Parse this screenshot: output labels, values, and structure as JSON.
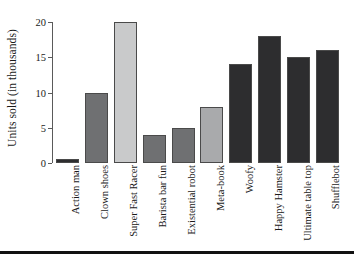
{
  "chart_data": {
    "type": "bar",
    "title": "",
    "xlabel": "",
    "ylabel": "Units sold (in thousands)",
    "ylim": [
      0,
      20
    ],
    "yticks": [
      0,
      5,
      10,
      15,
      20
    ],
    "ytick_labels": [
      "0",
      "5",
      "10",
      "15",
      "20"
    ],
    "grid": false,
    "legend": "none",
    "categories": [
      "Action man",
      "Clown shoes",
      "Super Fast Racer",
      "Barista bar fun",
      "Existential robot",
      "Meta-book",
      "Woofy",
      "Happy Hamster",
      "Ultimate table top",
      "Shufflebot"
    ],
    "values": [
      0.5,
      10,
      20,
      4,
      5,
      8,
      14,
      18,
      15,
      16
    ],
    "bar_colors": [
      "#2d2d2f",
      "#6f7072",
      "#c9cacb",
      "#6f7072",
      "#6f7072",
      "#a9aaac",
      "#2d2d2f",
      "#2d2d2f",
      "#2d2d2f",
      "#2d2d2f"
    ]
  },
  "style": {
    "background": "#ffffff",
    "axis_color": "#5a5a5a",
    "bar_edge_color": "#4a4a4a",
    "text_color": "#1a1a1a",
    "rule_color": "#111111"
  }
}
